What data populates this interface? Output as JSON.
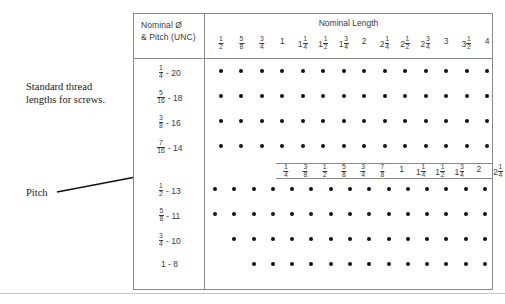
{
  "annotations": {
    "caption": "Standard thread\nlengths for screws.",
    "pitch_label": "Pitch"
  },
  "table": {
    "header": {
      "left_line1": "Nominal Ø",
      "left_line2": "& Pitch (UNC)",
      "length_title": "Nominal Length"
    },
    "top_scale": [
      {
        "whole": "",
        "num": "1",
        "den": "2"
      },
      {
        "whole": "",
        "num": "5",
        "den": "8"
      },
      {
        "whole": "",
        "num": "3",
        "den": "4"
      },
      {
        "whole": "1",
        "num": "",
        "den": ""
      },
      {
        "whole": "1",
        "num": "1",
        "den": "4"
      },
      {
        "whole": "1",
        "num": "1",
        "den": "2"
      },
      {
        "whole": "1",
        "num": "3",
        "den": "4"
      },
      {
        "whole": "2",
        "num": "",
        "den": ""
      },
      {
        "whole": "2",
        "num": "1",
        "den": "4"
      },
      {
        "whole": "2",
        "num": "1",
        "den": "2"
      },
      {
        "whole": "2",
        "num": "3",
        "den": "4"
      },
      {
        "whole": "3",
        "num": "",
        "den": ""
      },
      {
        "whole": "3",
        "num": "1",
        "den": "2"
      },
      {
        "whole": "4",
        "num": "",
        "den": ""
      }
    ],
    "mid_scale": [
      {
        "whole": "",
        "num": "1",
        "den": "4"
      },
      {
        "whole": "",
        "num": "3",
        "den": "8"
      },
      {
        "whole": "",
        "num": "1",
        "den": "2"
      },
      {
        "whole": "",
        "num": "5",
        "den": "8"
      },
      {
        "whole": "",
        "num": "3",
        "den": "4"
      },
      {
        "whole": "",
        "num": "7",
        "den": "8"
      },
      {
        "whole": "1",
        "num": "",
        "den": ""
      },
      {
        "whole": "1",
        "num": "1",
        "den": "4"
      },
      {
        "whole": "1",
        "num": "1",
        "den": "2"
      },
      {
        "whole": "1",
        "num": "3",
        "den": "4"
      },
      {
        "whole": "2",
        "num": "",
        "den": ""
      },
      {
        "whole": "2",
        "num": "1",
        "den": "4"
      },
      {
        "whole": "2",
        "num": "1",
        "den": "2"
      },
      {
        "whole": "2",
        "num": "3",
        "den": "4"
      },
      {
        "whole": "3",
        "num": "",
        "den": ""
      }
    ],
    "rows": [
      {
        "size": {
          "whole": "",
          "num": "1",
          "den": "4"
        },
        "pitch": "20",
        "scale": "top",
        "dot_columns": [
          0,
          1,
          2,
          3,
          4,
          5,
          6,
          7,
          8,
          9,
          10,
          11,
          12,
          13
        ]
      },
      {
        "size": {
          "whole": "",
          "num": "5",
          "den": "16"
        },
        "pitch": "18",
        "scale": "top",
        "dot_columns": [
          0,
          1,
          2,
          3,
          4,
          5,
          6,
          7,
          8,
          9,
          10,
          11,
          12,
          13
        ]
      },
      {
        "size": {
          "whole": "",
          "num": "3",
          "den": "8"
        },
        "pitch": "16",
        "scale": "top",
        "dot_columns": [
          0,
          1,
          2,
          3,
          4,
          5,
          6,
          7,
          8,
          9,
          10,
          11,
          12,
          13
        ]
      },
      {
        "size": {
          "whole": "",
          "num": "7",
          "den": "16"
        },
        "pitch": "14",
        "scale": "top",
        "dot_columns": [
          0,
          1,
          2,
          3,
          4,
          5,
          6,
          7,
          8,
          9,
          10,
          11,
          12,
          13
        ]
      },
      {
        "size": {
          "whole": "",
          "num": "1",
          "den": "2"
        },
        "pitch": "13",
        "scale": "mid",
        "dot_columns": [
          0,
          1,
          2,
          3,
          4,
          5,
          6,
          7,
          8,
          9,
          10,
          11,
          12,
          13,
          14
        ]
      },
      {
        "size": {
          "whole": "",
          "num": "5",
          "den": "8"
        },
        "pitch": "11",
        "scale": "mid",
        "dot_columns": [
          0,
          1,
          2,
          3,
          4,
          5,
          6,
          7,
          8,
          9,
          10,
          11,
          12,
          13,
          14
        ]
      },
      {
        "size": {
          "whole": "",
          "num": "3",
          "den": "4"
        },
        "pitch": "10",
        "scale": "mid",
        "dot_columns": [
          1,
          2,
          3,
          4,
          5,
          6,
          7,
          8,
          9,
          10,
          11,
          12,
          13,
          14
        ]
      },
      {
        "size": {
          "whole": "1",
          "num": "",
          "den": ""
        },
        "pitch": "8",
        "scale": "mid",
        "dot_columns": [
          2,
          3,
          4,
          5,
          6,
          7,
          8,
          9,
          10,
          11,
          12,
          13,
          14
        ]
      }
    ]
  }
}
